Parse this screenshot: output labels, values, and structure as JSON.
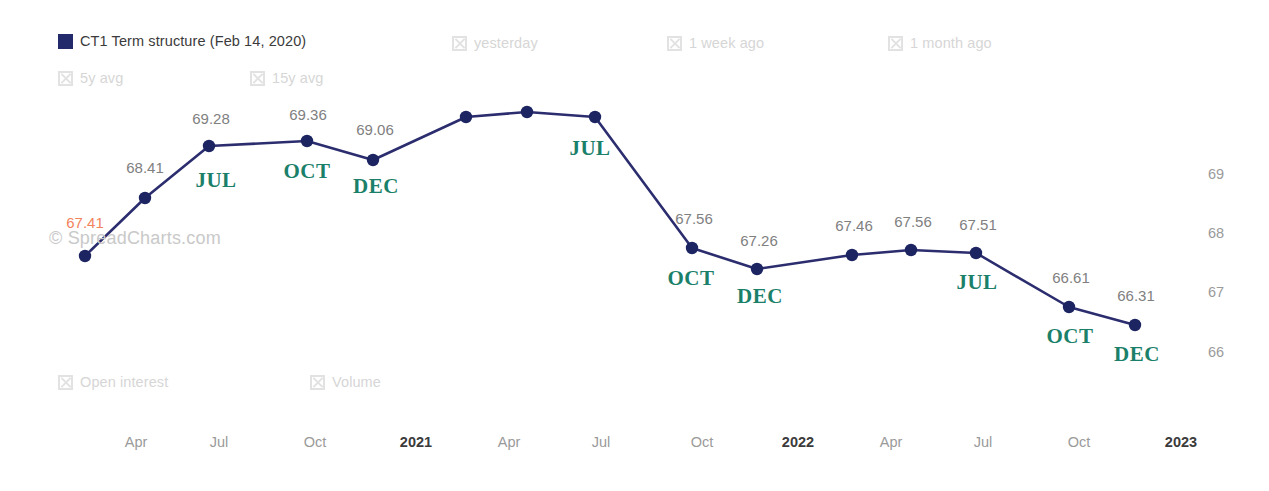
{
  "legend": {
    "row1": [
      {
        "label": "CT1 Term structure (Feb 14, 2020)",
        "state": "active",
        "icon": "filled-square-icon",
        "x": 58,
        "y": 34
      },
      {
        "label": "yesterday",
        "state": "inactive",
        "icon": "hidden-series-icon",
        "x": 452,
        "y": 36
      },
      {
        "label": "1 week ago",
        "state": "inactive",
        "icon": "hidden-series-icon",
        "x": 667,
        "y": 36
      },
      {
        "label": "1 month ago",
        "state": "inactive",
        "icon": "hidden-series-icon",
        "x": 888,
        "y": 36
      }
    ],
    "row2": [
      {
        "label": "5y avg",
        "state": "inactive",
        "icon": "hidden-series-icon",
        "x": 58,
        "y": 71
      },
      {
        "label": "15y avg",
        "state": "inactive",
        "icon": "hidden-series-icon",
        "x": 250,
        "y": 71
      }
    ],
    "row3": [
      {
        "label": "Open interest",
        "state": "inactive",
        "icon": "hidden-series-icon",
        "x": 58,
        "y": 375
      },
      {
        "label": "Volume",
        "state": "inactive",
        "icon": "hidden-series-icon",
        "x": 310,
        "y": 375
      }
    ]
  },
  "watermark": "© SpreadCharts.com",
  "colors": {
    "series_line": "#2b2d6e",
    "series_marker": "#1c2461",
    "legend_swatch": "#232a6b",
    "month_label": "#1b8069",
    "value_label": "#808080",
    "highlight_label": "#f2835c",
    "axis_label": "#9a9a9a",
    "axis_major_label": "#3b3b3b",
    "background": "#ffffff"
  },
  "chart_data": {
    "type": "line",
    "title": "CT1 Term structure (Feb 14, 2020)",
    "xlabel": "",
    "ylabel": "",
    "grid": false,
    "legend_position": "top",
    "y_axis_side": "right",
    "ylim": [
      65.6,
      69.7
    ],
    "yticks": [
      69,
      68,
      67,
      66
    ],
    "ytick_pixels": [
      167,
      226,
      285,
      345
    ],
    "xticks": [
      {
        "label": "Apr",
        "x": 136,
        "major": false
      },
      {
        "label": "Jul",
        "x": 219,
        "major": false
      },
      {
        "label": "Oct",
        "x": 315,
        "major": false
      },
      {
        "label": "2021",
        "x": 416,
        "major": true
      },
      {
        "label": "Apr",
        "x": 509,
        "major": false
      },
      {
        "label": "Jul",
        "x": 601,
        "major": false
      },
      {
        "label": "Oct",
        "x": 702,
        "major": false
      },
      {
        "label": "2022",
        "x": 798,
        "major": true
      },
      {
        "label": "Apr",
        "x": 891,
        "major": false
      },
      {
        "label": "Jul",
        "x": 983,
        "major": false
      },
      {
        "label": "Oct",
        "x": 1079,
        "major": false
      },
      {
        "label": "2023",
        "x": 1181,
        "major": true
      }
    ],
    "series": [
      {
        "name": "CT1 Term structure (Feb 14, 2020)",
        "color": "#2b2d6e",
        "points": [
          {
            "px": 85,
            "py": 256,
            "value": 67.41,
            "label": "67.41",
            "label_x": 85,
            "label_y": 215,
            "label_style": "highlight",
            "month": null
          },
          {
            "px": 145,
            "py": 198,
            "value": 68.41,
            "label": "68.41",
            "label_x": 145,
            "label_y": 160,
            "label_style": "normal",
            "month": null
          },
          {
            "px": 209,
            "py": 146,
            "value": 69.28,
            "label": "69.28",
            "label_x": 211,
            "label_y": 111,
            "label_style": "normal",
            "month": "JUL",
            "month_x": 216,
            "month_y": 170
          },
          {
            "px": 307,
            "py": 141,
            "value": 69.36,
            "label": "69.36",
            "label_x": 308,
            "label_y": 107,
            "label_style": "normal",
            "month": "OCT",
            "month_x": 307,
            "month_y": 161
          },
          {
            "px": 373,
            "py": 160,
            "value": 69.06,
            "label": "69.06",
            "label_x": 375,
            "label_y": 122,
            "label_style": "normal",
            "month": "DEC",
            "month_x": 376,
            "month_y": 176
          },
          {
            "px": 466,
            "py": 117,
            "value": null,
            "label": null,
            "label_x": null,
            "label_y": null,
            "label_style": "normal",
            "month": null
          },
          {
            "px": 527,
            "py": 112,
            "value": null,
            "label": null,
            "label_x": null,
            "label_y": null,
            "label_style": "normal",
            "month": null
          },
          {
            "px": 595,
            "py": 117,
            "value": null,
            "label": null,
            "label_x": null,
            "label_y": null,
            "label_style": "normal",
            "month": "JUL",
            "month_x": 590,
            "month_y": 138
          },
          {
            "px": 692,
            "py": 248,
            "value": 67.56,
            "label": "67.56",
            "label_x": 694,
            "label_y": 211,
            "label_style": "normal",
            "month": "OCT",
            "month_x": 691,
            "month_y": 268
          },
          {
            "px": 757,
            "py": 269,
            "value": 67.26,
            "label": "67.26",
            "label_x": 759,
            "label_y": 233,
            "label_style": "normal",
            "month": "DEC",
            "month_x": 760,
            "month_y": 286
          },
          {
            "px": 852,
            "py": 255,
            "value": 67.46,
            "label": "67.46",
            "label_x": 854,
            "label_y": 218,
            "label_style": "normal",
            "month": null
          },
          {
            "px": 911,
            "py": 250,
            "value": 67.56,
            "label": "67.56",
            "label_x": 913,
            "label_y": 214,
            "label_style": "normal",
            "month": null
          },
          {
            "px": 976,
            "py": 253,
            "value": 67.51,
            "label": "67.51",
            "label_x": 978,
            "label_y": 217,
            "label_style": "normal",
            "month": "JUL",
            "month_x": 977,
            "month_y": 272
          },
          {
            "px": 1069,
            "py": 307,
            "value": 66.61,
            "label": "66.61",
            "label_x": 1071,
            "label_y": 270,
            "label_style": "normal",
            "month": "OCT",
            "month_x": 1070,
            "month_y": 326
          },
          {
            "px": 1135,
            "py": 325,
            "value": 66.31,
            "label": "66.31",
            "label_x": 1136,
            "label_y": 288,
            "label_style": "normal",
            "month": "DEC",
            "month_x": 1137,
            "month_y": 344
          }
        ]
      }
    ]
  }
}
